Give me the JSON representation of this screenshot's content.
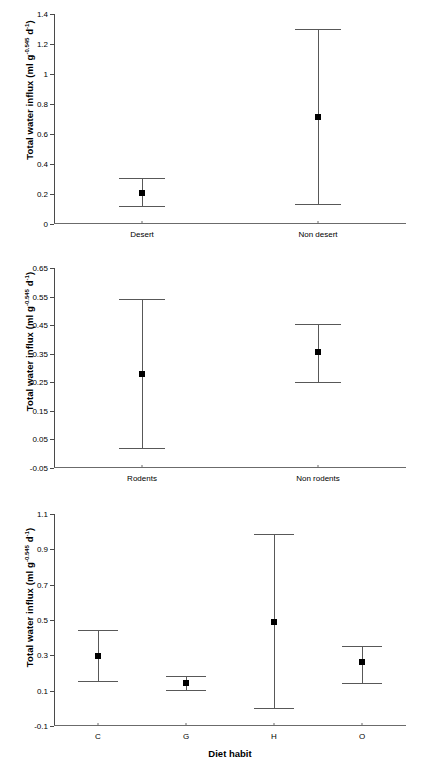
{
  "figure": {
    "background": "#ffffff",
    "line_color": "#585858",
    "marker_color": "#000000",
    "panel_count": 3
  },
  "chart_data": [
    {
      "type": "scatter",
      "panel": "a",
      "title": "",
      "xlabel": "",
      "ylabel": "Total water influx (ml g",
      "ylabel_exponent": "-0.545",
      "ylabel_tail": " d",
      "ylabel_tail_exponent": "-1",
      "ylabel_close": ")",
      "categories": [
        "Desert",
        "Non desert"
      ],
      "values": [
        0.21,
        0.715
      ],
      "error_low": [
        0.12,
        0.135
      ],
      "error_high": [
        0.31,
        1.3
      ],
      "ylim": [
        0,
        1.4
      ],
      "yticks": [
        0,
        0.2,
        0.4,
        0.6,
        0.8,
        1,
        1.2,
        1.4
      ],
      "ytick_labels": [
        "0",
        "0.2",
        "0.4",
        "0.6",
        "0.8",
        "1",
        "1.2",
        "1.4"
      ],
      "grid": false,
      "legend": "none"
    },
    {
      "type": "scatter",
      "panel": "b",
      "title": "",
      "xlabel": "",
      "ylabel": "Total water influx (ml g",
      "ylabel_exponent": "-0.545",
      "ylabel_tail": " d",
      "ylabel_tail_exponent": "-1",
      "ylabel_close": ")",
      "categories": [
        "Rodents",
        "Non rodents"
      ],
      "values": [
        0.28,
        0.355
      ],
      "error_low": [
        0.02,
        0.25
      ],
      "error_high": [
        0.54,
        0.455
      ],
      "ylim": [
        -0.05,
        0.65
      ],
      "yticks": [
        -0.05,
        0.05,
        0.15,
        0.25,
        0.35,
        0.45,
        0.55,
        0.65
      ],
      "ytick_labels": [
        "-0.05",
        "0.05",
        "0.15",
        "0.25",
        "0.35",
        "0.45",
        "0.55",
        "0.65"
      ],
      "grid": false,
      "legend": "none"
    },
    {
      "type": "scatter",
      "panel": "c",
      "title": "",
      "xlabel": "Diet habit",
      "ylabel": "Total water influx (ml g",
      "ylabel_exponent": "-0.545",
      "ylabel_tail": " d",
      "ylabel_tail_exponent": "-1",
      "ylabel_close": ")",
      "categories": [
        "C",
        "G",
        "H",
        "O"
      ],
      "values": [
        0.295,
        0.145,
        0.49,
        0.265
      ],
      "error_low": [
        0.155,
        0.105,
        0.0,
        0.145
      ],
      "error_high": [
        0.445,
        0.185,
        0.985,
        0.355
      ],
      "ylim": [
        -0.1,
        1.1
      ],
      "yticks": [
        -0.1,
        0.1,
        0.3,
        0.5,
        0.7,
        0.9,
        1.1
      ],
      "ytick_labels": [
        "-0.1",
        "0.1",
        "0.3",
        "0.5",
        "0.7",
        "0.9",
        "1.1"
      ],
      "grid": false,
      "legend": "none"
    }
  ]
}
